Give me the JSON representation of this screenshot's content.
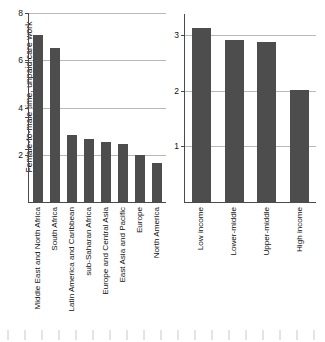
{
  "chart_data": [
    {
      "type": "bar",
      "panel": "left",
      "title": "",
      "xlabel": "",
      "ylabel": "Female-to-male time, unpaid care work",
      "ylim": [
        0,
        8
      ],
      "yticks": [
        2,
        4,
        6,
        8
      ],
      "grid": true,
      "legend": "none",
      "bar_color": "#4d4d4d",
      "categories": [
        "Middle East and North Africa",
        "South Africa",
        "Latin America and Caribbean",
        "sub-Saharan Africa",
        "Europe and Central Asia",
        "East Asia and Pacific",
        "Europe",
        "North America"
      ],
      "values": [
        7.1,
        6.55,
        2.85,
        2.7,
        2.55,
        2.45,
        2.0,
        1.65
      ]
    },
    {
      "type": "bar",
      "panel": "right",
      "title": "",
      "xlabel": "",
      "ylabel": "",
      "ylim": [
        0,
        3.4
      ],
      "yticks": [
        1,
        2,
        3
      ],
      "grid": true,
      "legend": "none",
      "bar_color": "#4d4d4d",
      "categories": [
        "Low income",
        "Lower-middle",
        "Upper-middle",
        "High income"
      ],
      "values": [
        3.15,
        2.93,
        2.9,
        2.03
      ]
    }
  ]
}
